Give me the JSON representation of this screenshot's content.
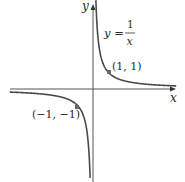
{
  "chart_data": {
    "type": "line",
    "title": "",
    "function": "y = 1/x",
    "xlabel": "x",
    "ylabel": "y",
    "equation_label": {
      "lhs": "y =",
      "numerator": "1",
      "denominator": "x"
    },
    "points": [
      {
        "label": "(1, 1)",
        "x": 1,
        "y": 1
      },
      {
        "label": "(−1, −1)",
        "x": -1,
        "y": -1
      }
    ],
    "branches": [
      {
        "name": "positive",
        "x_range": [
          0.18,
          5.2
        ]
      },
      {
        "name": "negative",
        "x_range": [
          -5.2,
          -0.18
        ]
      }
    ],
    "xlim": [
      -5.3,
      5.2
    ],
    "ylim": [
      -5.5,
      5.3
    ],
    "grid": false,
    "legend": null,
    "colors": {
      "curve": "#4a4a4a",
      "axis": "#555555",
      "point": "#666666"
    }
  },
  "labels": {
    "x_axis": "x",
    "y_axis": "y",
    "eq_lhs": "y =",
    "eq_num": "1",
    "eq_den": "x",
    "pt1": "(1, 1)",
    "pt2": "(−1, −1)"
  }
}
